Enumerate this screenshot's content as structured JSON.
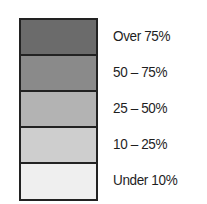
{
  "chart_data": {
    "type": "table",
    "title": "",
    "legend_position": "left-swatches-right-labels",
    "categories": [
      "Over 75%",
      "50 – 75%",
      "25 – 50%",
      "10 – 25%",
      "Under 10%"
    ],
    "colors": [
      "#6b6b6b",
      "#8a8a8a",
      "#b3b3b3",
      "#cecece",
      "#efefef"
    ]
  },
  "legend": {
    "items": [
      {
        "label": "Over 75%",
        "color": "#6b6b6b"
      },
      {
        "label": "50 – 75%",
        "color": "#8a8a8a"
      },
      {
        "label": "25 – 50%",
        "color": "#b3b3b3"
      },
      {
        "label": "10 – 25%",
        "color": "#cecece"
      },
      {
        "label": "Under 10%",
        "color": "#efefef"
      }
    ]
  }
}
